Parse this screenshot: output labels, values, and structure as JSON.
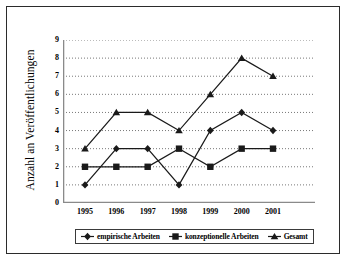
{
  "chart_data": {
    "type": "line",
    "title": "",
    "xlabel": "",
    "ylabel": "Anzahl an Veröffentlichungen",
    "categories": [
      "1995",
      "1996",
      "1997",
      "1998",
      "1999",
      "2000",
      "2001"
    ],
    "ylim": [
      0,
      9
    ],
    "yticks": [
      "0",
      "1",
      "2",
      "3",
      "4",
      "5",
      "6",
      "7",
      "8",
      "9"
    ],
    "grid": "horizontal-dotted",
    "legend_position": "bottom",
    "series": [
      {
        "name": "empirische Arbeiten",
        "marker": "diamond",
        "color": "#1a1a1a",
        "values": [
          1,
          3,
          3,
          1,
          4,
          5,
          4
        ]
      },
      {
        "name": "konzeptionelle Arbeiten",
        "marker": "square",
        "color": "#1a1a1a",
        "values": [
          2,
          2,
          2,
          3,
          2,
          3,
          3
        ]
      },
      {
        "name": "Gesamt",
        "marker": "triangle",
        "color": "#1a1a1a",
        "values": [
          3,
          5,
          5,
          4,
          6,
          8,
          7
        ]
      }
    ]
  }
}
